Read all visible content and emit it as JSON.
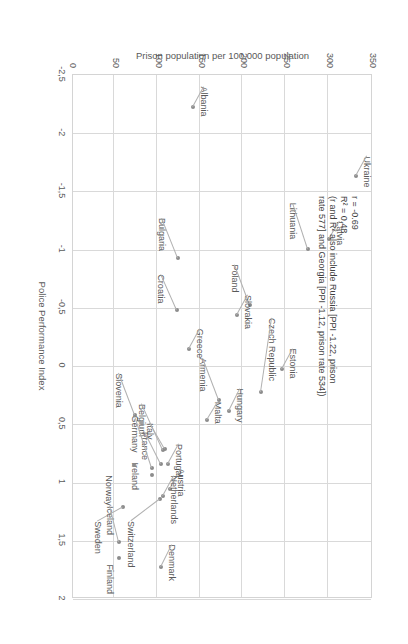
{
  "chart_data": {
    "type": "scatter",
    "title": "",
    "xlabel": "Police Performance Index",
    "ylabel": "Prison population per 100,000 population",
    "xlim": [
      -2.5,
      2
    ],
    "ylim": [
      0,
      350
    ],
    "xticks": [
      "-2,5",
      "-2",
      "-1,5",
      "-1",
      "-0,5",
      "0",
      "0,5",
      "1",
      "1,5",
      "2"
    ],
    "xtick_values": [
      -2.5,
      -2,
      -1.5,
      -1,
      -0.5,
      0,
      0.5,
      1,
      1.5,
      2
    ],
    "yticks": [
      "0",
      "50",
      "100",
      "150",
      "200",
      "250",
      "300",
      "350"
    ],
    "ytick_values": [
      0,
      50,
      100,
      150,
      200,
      250,
      300,
      350
    ],
    "grid": true,
    "legend": "none",
    "points": [
      {
        "label": "Ukraine",
        "x": -1.62,
        "y": 331,
        "lx": -20,
        "ly": -16
      },
      {
        "label": "Latvia",
        "x": -1.08,
        "y": 300,
        "lx": -18,
        "ly": -16
      },
      {
        "label": "Lithuania",
        "x": -1.0,
        "y": 275,
        "lx": -46,
        "ly": 10
      },
      {
        "label": "Poland",
        "x": -0.52,
        "y": 208,
        "lx": -40,
        "ly": 10
      },
      {
        "label": "Slovakia",
        "x": -0.43,
        "y": 193,
        "lx": -20,
        "ly": -16
      },
      {
        "label": "Estonia",
        "x": 0.03,
        "y": 245,
        "lx": -20,
        "ly": -16
      },
      {
        "label": "Czech Republic",
        "x": 0.23,
        "y": 220,
        "lx": -74,
        "ly": -16
      },
      {
        "label": "Hungary",
        "x": 0.39,
        "y": 183,
        "lx": -22,
        "ly": -16
      },
      {
        "label": "Armenia",
        "x": 0.3,
        "y": 172,
        "lx": -42,
        "ly": 11
      },
      {
        "label": "Malta",
        "x": 0.47,
        "y": 158,
        "lx": -18,
        "ly": -16
      },
      {
        "label": "Albania",
        "x": -2.22,
        "y": 141,
        "lx": -20,
        "ly": -16
      },
      {
        "label": "Bulgaria",
        "x": -0.92,
        "y": 124,
        "lx": -40,
        "ly": 11
      },
      {
        "label": "Croatia",
        "x": -0.47,
        "y": 122,
        "lx": -36,
        "ly": 11
      },
      {
        "label": "Greece",
        "x": -0.14,
        "y": 137,
        "lx": -20,
        "ly": -16
      },
      {
        "label": "Italy",
        "x": 0.72,
        "y": 109,
        "lx": -26,
        "ly": 10
      },
      {
        "label": "Belgium",
        "x": 0.73,
        "y": 106,
        "lx": -46,
        "ly": 16
      },
      {
        "label": "Portugal",
        "x": 0.85,
        "y": 112,
        "lx": -20,
        "ly": -16
      },
      {
        "label": "France",
        "x": 0.85,
        "y": 104,
        "lx": -32,
        "ly": 11
      },
      {
        "label": "Germany",
        "x": 0.88,
        "y": 93,
        "lx": -52,
        "ly": 12
      },
      {
        "label": "Ireland",
        "x": 0.94,
        "y": 93,
        "lx": -12,
        "ly": 12
      },
      {
        "label": "Austria",
        "x": 1.06,
        "y": 114,
        "lx": -20,
        "ly": -16
      },
      {
        "label": "Netherlands",
        "x": 1.12,
        "y": 106,
        "lx": -20,
        "ly": -16
      },
      {
        "label": "Switzerland",
        "x": 1.15,
        "y": 103,
        "lx": 22,
        "ly": 24
      },
      {
        "label": "Slovenia",
        "x": 0.43,
        "y": 74,
        "lx": -42,
        "ly": 11
      },
      {
        "label": "Norway",
        "x": 0.86,
        "y": 72,
        "lx": 10,
        "ly": 20
      },
      {
        "label": "Denmark",
        "x": 1.73,
        "y": 104,
        "lx": -22,
        "ly": -16
      },
      {
        "label": "Sweden",
        "x": 1.22,
        "y": 59,
        "lx": 14,
        "ly": 20
      },
      {
        "label": "Iceland",
        "x": 1.52,
        "y": 55,
        "lx": -36,
        "ly": 4
      },
      {
        "label": "Finland",
        "x": 1.66,
        "y": 55,
        "lx": 6,
        "ly": 4
      }
    ],
    "annotation": {
      "r_line": "r = -0.69",
      "r2_line": "R² = 0.48",
      "note_line_1": "(r and R² also include Russia [PPI -1.22, prison",
      "note_line_2": "rate 577] and Georgia [PPI -1.12, prison rate 534])"
    }
  }
}
